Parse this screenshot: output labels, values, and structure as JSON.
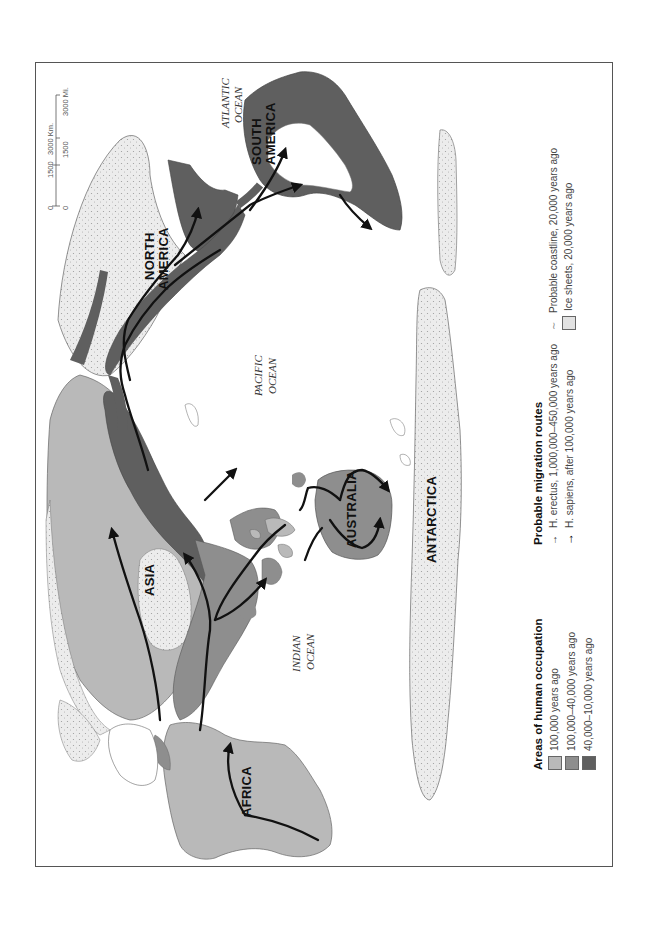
{
  "map": {
    "continents": {
      "africa": "AFRICA",
      "asia": "ASIA",
      "australia": "AUSTRALIA",
      "antarctica": "ANTARCTICA",
      "north_america_1": "NORTH",
      "north_america_2": "AMERICA",
      "south_america_1": "SOUTH",
      "south_america_2": "AMERICA"
    },
    "oceans": {
      "atlantic_1": "ATLANTIC",
      "atlantic_2": "OCEAN",
      "pacific_1": "PACIFIC",
      "pacific_2": "OCEAN",
      "indian_1": "INDIAN",
      "indian_2": "OCEAN"
    },
    "scale": {
      "km_ticks": [
        "0",
        "1500",
        "3000 Km."
      ],
      "mi_ticks": [
        "0",
        "1500",
        "3000 Mi."
      ]
    }
  },
  "legend": {
    "occupation": {
      "title": "Areas of human occupation",
      "items": [
        {
          "label": "100,000 years ago",
          "color": "#b9b9b9"
        },
        {
          "label": "100,000–40,000 years ago",
          "color": "#8e8e8e"
        },
        {
          "label": "40,000–10,000 years ago",
          "color": "#5f5f5f"
        }
      ]
    },
    "migration": {
      "title": "Probable migration routes",
      "items": [
        {
          "label": "H. erectus, 1,000,000–450,000 years ago",
          "color": "#333333"
        },
        {
          "label": "H. sapiens, after 100,000 years ago",
          "color": "#000000"
        }
      ]
    },
    "other": {
      "items": [
        {
          "label": "Probable coastline, 20,000 years ago"
        },
        {
          "label": "Ice sheets, 20,000 years ago",
          "color": "#e2e2e2"
        }
      ]
    }
  },
  "colors": {
    "occ_100k": "#b9b9b9",
    "occ_100k_40k": "#8e8e8e",
    "occ_40k_10k": "#5f5f5f",
    "ice": "#e6e6e6",
    "route": "#111111"
  }
}
